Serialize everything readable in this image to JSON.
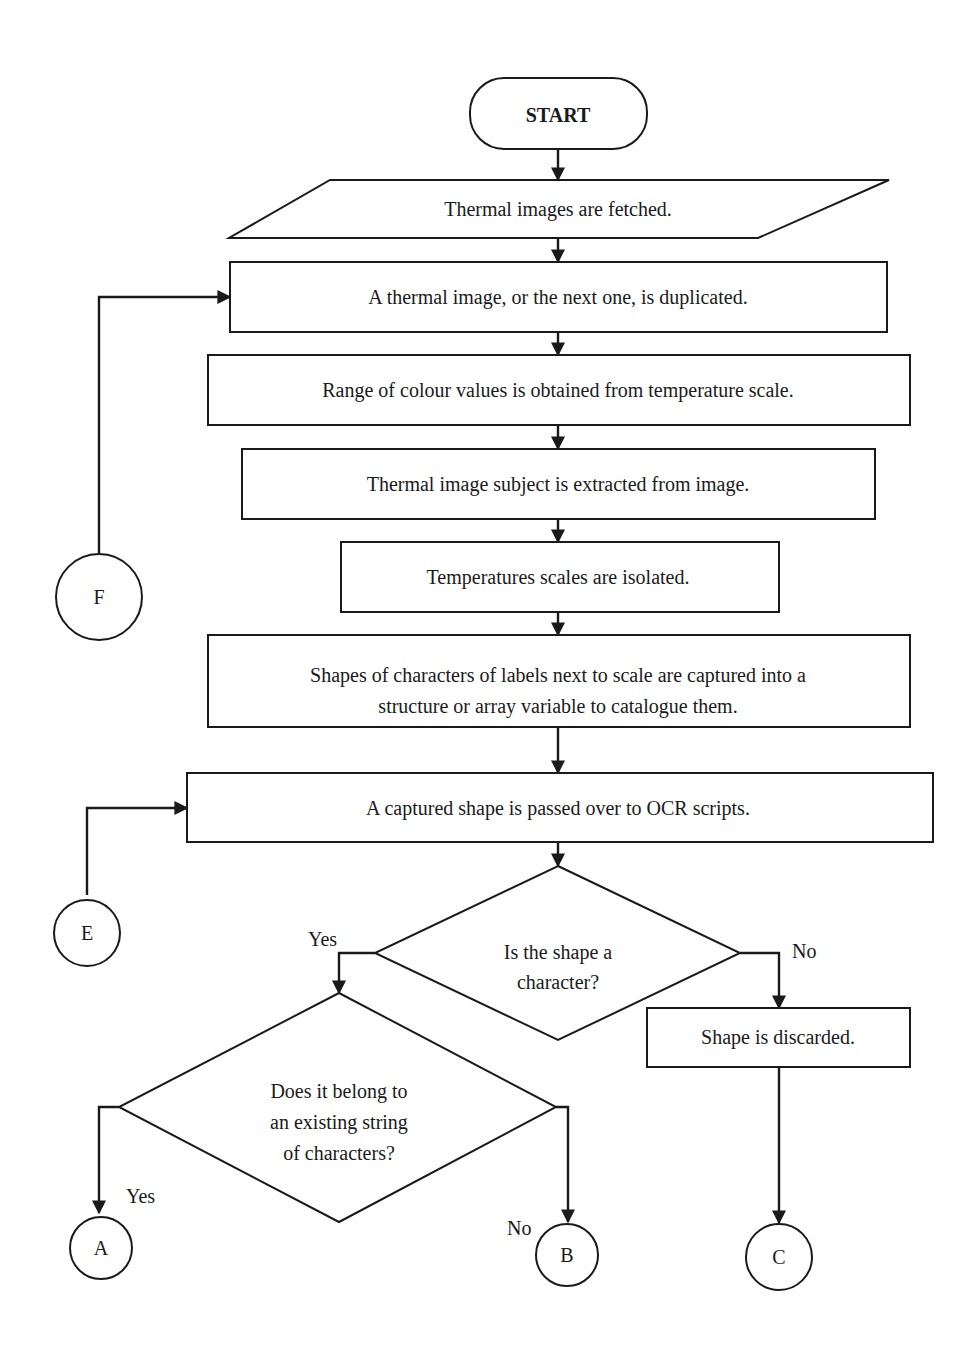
{
  "flowchart": {
    "start": {
      "label": "START"
    },
    "io_fetch": {
      "label": "Thermal images are fetched."
    },
    "process": [
      {
        "id": "duplicate",
        "lines": [
          "A thermal image, or the next one, is duplicated."
        ]
      },
      {
        "id": "colour_range",
        "lines": [
          "Range of colour values is obtained from temperature scale."
        ]
      },
      {
        "id": "extract_subject",
        "lines": [
          "Thermal image subject is extracted from image."
        ]
      },
      {
        "id": "isolate_scales",
        "lines": [
          "Temperatures scales are isolated."
        ]
      },
      {
        "id": "capture_shapes",
        "lines": [
          "Shapes of characters of labels next to scale are captured into a",
          "structure or array variable to catalogue them."
        ]
      },
      {
        "id": "pass_ocr",
        "lines": [
          "A captured shape is passed over to OCR scripts."
        ]
      },
      {
        "id": "discard",
        "lines": [
          "Shape is discarded."
        ]
      }
    ],
    "decisions": [
      {
        "id": "is_character",
        "lines": [
          "Is the shape a",
          "character?"
        ],
        "yes": "Yes",
        "no": "No"
      },
      {
        "id": "belongs_to_string",
        "lines": [
          "Does it belong to",
          "an existing string",
          "of characters?"
        ],
        "yes": "Yes",
        "no": "No"
      }
    ],
    "connectors": {
      "F": "F",
      "E": "E",
      "A": "A",
      "B": "B",
      "C": "C"
    }
  }
}
